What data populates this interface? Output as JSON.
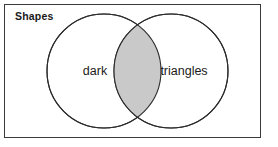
{
  "figure": {
    "title": "Shapes",
    "type": "venn-diagram",
    "background_color": "#ffffff",
    "frame": {
      "stroke_color": "#3a3a3a",
      "stroke_width": 1,
      "x": 4,
      "y": 4,
      "width": 257,
      "height": 134
    },
    "sets": [
      {
        "id": "left",
        "label": "dark",
        "center_x": 104,
        "center_y": 71,
        "radius": 57,
        "fill_color": "#ffffff",
        "stroke_color": "#2b2b2b",
        "label_x": 95,
        "label_y": 71
      },
      {
        "id": "right",
        "label": "triangles",
        "center_x": 171,
        "center_y": 71,
        "radius": 57,
        "fill_color": "#ffffff",
        "stroke_color": "#2b2b2b",
        "label_x": 184,
        "label_y": 71
      }
    ],
    "intersection": {
      "label": "",
      "fill_color": "#c9c9c9",
      "stroke_color": "#2b2b2b",
      "shaded": true
    },
    "title_position": {
      "x": 15,
      "y": 20
    }
  }
}
